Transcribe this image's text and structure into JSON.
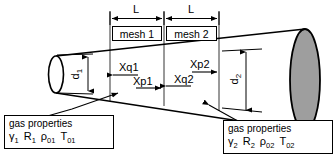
{
  "diagram": {
    "colors": {
      "line": "#000000",
      "outlet_fill": "#9e9e9e",
      "inlet_fill": "#ffffff",
      "background": "#ffffff"
    }
  },
  "dimensions": {
    "length_left": "L",
    "length_right": "L",
    "diameter_inlet": "d",
    "diameter_inlet_sub": "1",
    "diameter_outlet": "d",
    "diameter_outlet_sub": "2"
  },
  "meshes": [
    {
      "label": "mesh 1"
    },
    {
      "label": "mesh 2"
    }
  ],
  "node_labels": [
    {
      "name": "Xq1",
      "text": "Xq1",
      "direction": "left"
    },
    {
      "name": "Xp1",
      "text": "Xp1",
      "direction": "right"
    },
    {
      "name": "Xp2",
      "text": "Xp2",
      "direction": "right"
    },
    {
      "name": "Xq2",
      "text": "Xq2",
      "direction": "left"
    }
  ],
  "gas_properties_left": {
    "title": "gas properties",
    "gamma": "γ",
    "gamma_sub": "1",
    "R": "R",
    "R_sub": "1",
    "rho": "ρ",
    "rho_sub": "01",
    "T": "T",
    "T_sub": "01"
  },
  "gas_properties_right": {
    "title": "gas properties",
    "gamma": "γ",
    "gamma_sub": "2",
    "R": "R",
    "R_sub": "2",
    "rho": "ρ",
    "rho_sub": "02",
    "T": "T",
    "T_sub": "02"
  }
}
